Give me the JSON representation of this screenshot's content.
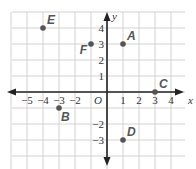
{
  "chart_data": {
    "type": "scatter",
    "title": "",
    "xlabel": "x",
    "ylabel": "y",
    "origin_label": "O",
    "xlim": [
      -6,
      5
    ],
    "ylim": [
      -5,
      5
    ],
    "grid": true,
    "x_ticks": [
      -5,
      -4,
      -3,
      -2,
      1,
      2,
      3,
      4
    ],
    "x_tick_labels": [
      "−5",
      "−4",
      "−3",
      "−2",
      "1",
      "2",
      "3",
      "4"
    ],
    "y_ticks": [
      4,
      3,
      2,
      1,
      -2,
      -3
    ],
    "y_tick_labels": [
      "4",
      "3",
      "2",
      "1",
      "−2",
      "−3"
    ],
    "points": [
      {
        "label": "A",
        "x": 1,
        "y": 3,
        "label_pos": "upper-right"
      },
      {
        "label": "B",
        "x": -3,
        "y": -1,
        "label_pos": "lower-right"
      },
      {
        "label": "C",
        "x": 3,
        "y": 0,
        "label_pos": "upper-right"
      },
      {
        "label": "D",
        "x": 1,
        "y": -3,
        "label_pos": "upper-right"
      },
      {
        "label": "E",
        "x": -4,
        "y": 4,
        "label_pos": "upper-right"
      },
      {
        "label": "F",
        "x": -1,
        "y": 3,
        "label_pos": "lower-left"
      }
    ],
    "colors": {
      "grid": "#c8c8c8",
      "axis": "#222222",
      "point": "#555555",
      "label": "#555555"
    }
  }
}
